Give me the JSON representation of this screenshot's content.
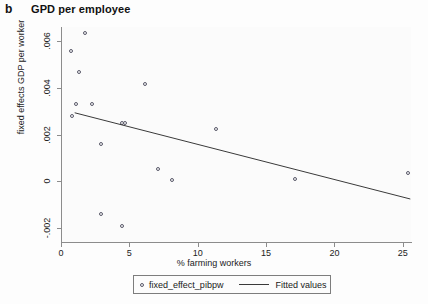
{
  "panel": {
    "label": "b"
  },
  "chart_data": {
    "type": "scatter",
    "title": "GPD per employee",
    "xlabel": "% farming workers",
    "ylabel": "fixed effects GDP per worker",
    "xlim": [
      0,
      25.6
    ],
    "ylim": [
      -0.0026,
      0.0066
    ],
    "xticks": [
      0,
      5,
      10,
      15,
      20,
      25
    ],
    "xtick_labels": [
      "0",
      "5",
      "10",
      "15",
      "20",
      "25"
    ],
    "yticks": [
      0.006,
      0.004,
      0.002,
      0,
      -0.002
    ],
    "ytick_labels": [
      ".006",
      ".004",
      ".002",
      "0",
      "-.002"
    ],
    "grid": false,
    "legend_position": "bottom",
    "series": [
      {
        "name": "fixed_effect_pibpw",
        "type": "scatter",
        "points": [
          {
            "x": 1.75,
            "y": 0.00634
          },
          {
            "x": 0.73,
            "y": 0.00556
          },
          {
            "x": 1.31,
            "y": 0.00468
          },
          {
            "x": 6.13,
            "y": 0.00415
          },
          {
            "x": 1.09,
            "y": 0.00332
          },
          {
            "x": 2.26,
            "y": 0.00332
          },
          {
            "x": 0.8,
            "y": 0.00278
          },
          {
            "x": 4.45,
            "y": 0.00249
          },
          {
            "x": 4.67,
            "y": 0.00249
          },
          {
            "x": 11.31,
            "y": 0.00224
          },
          {
            "x": 2.92,
            "y": 0.00161
          },
          {
            "x": 7.08,
            "y": 0.00054
          },
          {
            "x": 8.1,
            "y": 5e-05
          },
          {
            "x": 17.15,
            "y": 0.0001
          },
          {
            "x": 25.4,
            "y": 0.00034
          },
          {
            "x": 2.92,
            "y": -0.00141
          },
          {
            "x": 4.45,
            "y": -0.0019
          }
        ]
      },
      {
        "name": "Fitted values",
        "type": "line",
        "endpoints": [
          {
            "x": 1.0,
            "y": 0.00293
          },
          {
            "x": 25.55,
            "y": -0.00076
          }
        ]
      }
    ]
  },
  "legend": {
    "scatter_label": "fixed_effect_pibpw",
    "line_label": "Fitted values"
  }
}
